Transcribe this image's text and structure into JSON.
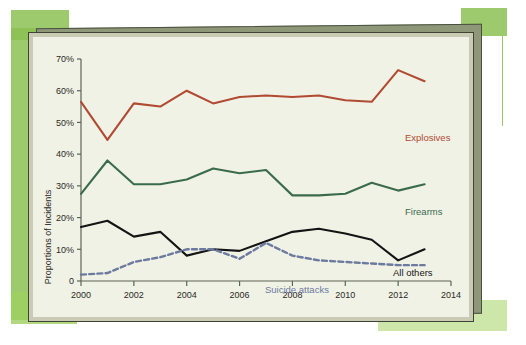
{
  "chart_data": {
    "type": "line",
    "title": "",
    "xlabel": "",
    "ylabel": "Proportions of Incidents",
    "x": [
      2000,
      2001,
      2002,
      2003,
      2004,
      2005,
      2006,
      2007,
      2008,
      2009,
      2010,
      2011,
      2012,
      2013
    ],
    "xlim": [
      2000,
      2014
    ],
    "ylim": [
      0,
      70
    ],
    "xticks": [
      "2000",
      "2002",
      "2004",
      "2006",
      "2008",
      "2010",
      "2012",
      "2014"
    ],
    "xtick_values": [
      2000,
      2002,
      2004,
      2006,
      2008,
      2010,
      2012,
      2014
    ],
    "yticks": [
      "0",
      "10%",
      "20%",
      "30%",
      "40%",
      "50%",
      "60%",
      "70%"
    ],
    "ytick_values": [
      0,
      10,
      20,
      30,
      40,
      50,
      60,
      70
    ],
    "grid": false,
    "legend_position": "inline-right",
    "series": [
      {
        "name": "Explosives",
        "color": "#b04a32",
        "style": "solid",
        "values": [
          56.5,
          44.5,
          56.0,
          55.0,
          60.0,
          56.0,
          58.0,
          58.5,
          58.0,
          58.5,
          57.0,
          56.5,
          66.5,
          63.0
        ]
      },
      {
        "name": "Firearms",
        "color": "#3a6b4a",
        "style": "solid",
        "values": [
          27.5,
          38.0,
          30.5,
          30.5,
          32.0,
          35.5,
          34.0,
          35.0,
          27.0,
          27.0,
          27.5,
          31.0,
          28.5,
          30.5
        ]
      },
      {
        "name": "All others",
        "color": "#141414",
        "style": "solid",
        "values": [
          17.0,
          19.0,
          14.0,
          15.5,
          8.0,
          10.0,
          9.5,
          12.5,
          15.5,
          16.5,
          15.0,
          13.0,
          6.5,
          10.0
        ]
      },
      {
        "name": "Suicide attacks",
        "color": "#6b7a9e",
        "style": "dashed",
        "values": [
          2.0,
          2.5,
          6.0,
          7.5,
          10.0,
          10.0,
          7.0,
          12.0,
          8.0,
          6.5,
          6.0,
          5.5,
          5.0,
          5.0
        ]
      }
    ]
  },
  "credit": {
    "source_text": "Based on the “Global Terrorism Index, 2014,” Institute for Economics and Peace, p. 29."
  }
}
